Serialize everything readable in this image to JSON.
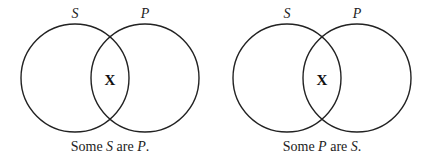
{
  "diagrams": [
    {
      "left_label": "S",
      "right_label": "P",
      "mark": "X",
      "caption": {
        "w1": "Some ",
        "t1": "S",
        "w2": " are ",
        "t2": "P",
        "w3": "."
      }
    },
    {
      "left_label": "S",
      "right_label": "P",
      "mark": "X",
      "caption": {
        "w1": "Some ",
        "t1": "P",
        "w2": " are ",
        "t2": "S",
        "w3": "."
      }
    }
  ]
}
